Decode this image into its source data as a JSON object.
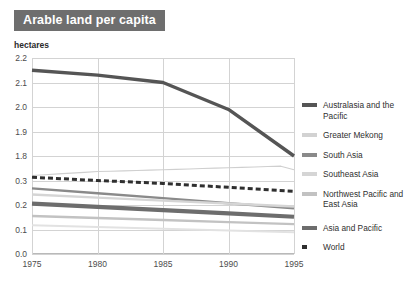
{
  "header": {
    "title": "Arable land per capita",
    "title_bg": "#6e6e6e",
    "title_color": "#ffffff"
  },
  "chart_data": {
    "type": "line",
    "title": "Arable land per capita",
    "subtitle": "",
    "xlabel": "",
    "ylabel": "hectares",
    "unit": "hectares",
    "grid": true,
    "legend_position": "right",
    "axis_note": "broken y-axis: upper band 1.8-2.2, lower band 0.0-0.3",
    "x": [
      1975,
      1980,
      1985,
      1990,
      1995
    ],
    "xlim": [
      1975,
      1995
    ],
    "xticks": [
      "1975",
      "1980",
      "1985",
      "1990",
      "1995"
    ],
    "yticks": [
      "2.2",
      "2.1",
      "2.0",
      "1.9",
      "1.8",
      "0.3",
      "0.2",
      "0.1",
      "0.0"
    ],
    "ylim_upper": [
      1.8,
      2.2
    ],
    "ylim_lower": [
      0.0,
      0.3
    ],
    "series": [
      {
        "name": "Australasia and the Pacific",
        "color": "#555555",
        "style": "solid",
        "width": 3.4,
        "values": [
          2.15,
          2.13,
          2.1,
          1.99,
          1.8
        ]
      },
      {
        "name": "Greater Mekong",
        "color": "#cfcfcf",
        "style": "solid",
        "width": 1.1,
        "values": [
          0.325,
          0.338,
          0.342,
          0.347,
          0.352
        ]
      },
      {
        "name": "South Asia",
        "color": "#8a8a8a",
        "style": "solid",
        "width": 2.4,
        "values": [
          0.268,
          0.248,
          0.228,
          0.207,
          0.187
        ]
      },
      {
        "name": "Southeast Asia",
        "color": "#d5d5d5",
        "style": "solid",
        "width": 2.4,
        "values": [
          0.243,
          0.23,
          0.218,
          0.206,
          0.194
        ]
      },
      {
        "name": "Northwest Pacific and East Asia",
        "color": "#c2c2c2",
        "style": "solid",
        "width": 2.4,
        "values": [
          0.155,
          0.147,
          0.139,
          0.13,
          0.122
        ]
      },
      {
        "name": "Asia and Pacific",
        "color": "#6d6d6d",
        "style": "solid",
        "width": 4.2,
        "values": [
          0.206,
          0.192,
          0.179,
          0.166,
          0.152
        ]
      },
      {
        "name": "World",
        "color": "#2f2f2f",
        "style": "dashed",
        "width": 3.0,
        "values": [
          0.313,
          0.3,
          0.288,
          0.272,
          0.256
        ]
      },
      {
        "name": "lower-extra-line",
        "color": "#e2e2e2",
        "style": "solid",
        "width": 2.0,
        "hidden_from_legend": true,
        "values": [
          0.117,
          0.11,
          0.103,
          0.096,
          0.089
        ]
      }
    ]
  },
  "legend": {
    "items": [
      {
        "label": "Australasia and the Pacific",
        "color": "#555555",
        "style": "solid"
      },
      {
        "label": "Greater Mekong",
        "color": "#d2d2d2",
        "style": "solid"
      },
      {
        "label": "South Asia",
        "color": "#8a8a8a",
        "style": "solid"
      },
      {
        "label": "Southeast Asia",
        "color": "#d5d5d5",
        "style": "solid"
      },
      {
        "label": "Northwest Pacific and East Asia",
        "color": "#c2c2c2",
        "style": "solid"
      }
    ],
    "items_group2": [
      {
        "label": "Asia and Pacific",
        "color": "#6d6d6d",
        "style": "solid"
      },
      {
        "label": "World",
        "color": "#2f2f2f",
        "style": "dashed"
      }
    ]
  }
}
